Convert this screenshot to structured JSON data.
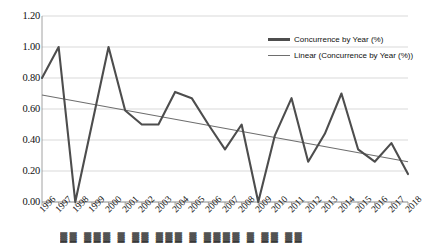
{
  "chart_data": {
    "type": "line",
    "title": "",
    "xlabel": "",
    "ylabel": "",
    "categories": [
      "1996",
      "1997",
      "1998",
      "1999",
      "2000",
      "2001",
      "2002",
      "2003",
      "2004",
      "2005",
      "2006",
      "2007",
      "2008",
      "2009",
      "2010",
      "2011",
      "2012",
      "2013",
      "2014",
      "2015",
      "2016",
      "2017",
      "2018"
    ],
    "series": [
      {
        "name": "Concurrence by Year (%)",
        "type": "line",
        "color": "#4d4d4d",
        "values": [
          0.8,
          1.0,
          0.0,
          0.5,
          1.0,
          0.59,
          0.5,
          0.5,
          0.71,
          0.67,
          0.5,
          0.34,
          0.5,
          0.0,
          0.43,
          0.67,
          0.26,
          0.44,
          0.7,
          0.34,
          0.26,
          0.38,
          0.21
        ]
      },
      {
        "name": "Linear (Concurrence by Year (%))",
        "type": "trendline",
        "color": "#6e6e6e",
        "endpoints": [
          0.69,
          0.26
        ]
      }
    ],
    "series_last_point": 0.18,
    "ylim": [
      0.0,
      1.2
    ],
    "yticks": [
      "0.00",
      "0.20",
      "0.40",
      "0.60",
      "0.80",
      "1.00",
      "1.20"
    ],
    "ytick_values": [
      0.0,
      0.2,
      0.4,
      0.6,
      0.8,
      1.0,
      1.2
    ],
    "grid": "horizontal",
    "legend_position": "top-right"
  },
  "legend": {
    "items": [
      {
        "label": "Concurrence by Year (%)"
      },
      {
        "label": "Linear (Concurrence by Year (%))"
      }
    ]
  },
  "caption": {
    "text": "▓▓ ▓▓▓ ▓ ▓▓ ▓▓▓ ▓ ▓▓▓▓ ▓ ▓▓ ▓▓"
  }
}
